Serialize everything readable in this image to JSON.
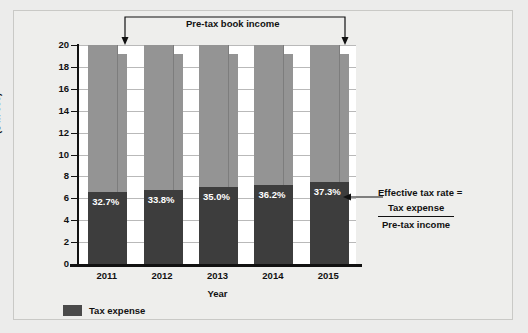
{
  "chart_data": {
    "type": "bar",
    "title": "",
    "subtitle": "",
    "xlabel": "Year",
    "ylabel": "($ in 000)",
    "ylim": [
      0,
      20
    ],
    "yticks": [
      0,
      2,
      4,
      6,
      8,
      10,
      12,
      14,
      16,
      18,
      20
    ],
    "grid": true,
    "legend_position": "bottom-left",
    "stacked": true,
    "categories": [
      "2011",
      "2012",
      "2013",
      "2014",
      "2015"
    ],
    "series": [
      {
        "name": "Tax expense",
        "values": [
          6.54,
          6.76,
          7.0,
          7.24,
          7.46
        ],
        "color": "#3d3d3d"
      },
      {
        "name": "Pre-tax book income",
        "values": [
          20,
          20,
          20,
          20,
          20
        ],
        "color": "#949494"
      }
    ],
    "data_labels": [
      "32.7%",
      "33.8%",
      "35.0%",
      "36.2%",
      "37.3%"
    ],
    "annotations": [
      {
        "name": "pre-tax-book-income",
        "text": "Pre-tax book income",
        "position": "top"
      },
      {
        "name": "effective-tax-rate",
        "text": "Effective tax rate = Tax expense / Pre-tax income",
        "position": "right"
      }
    ]
  },
  "axes": {
    "y_title": "($ in 000)",
    "x_title": "Year",
    "y_ticks": [
      "20",
      "18",
      "16",
      "14",
      "12",
      "10",
      "8",
      "6",
      "4",
      "2",
      "0"
    ],
    "x_ticks": [
      "2011",
      "2012",
      "2013",
      "2014",
      "2015"
    ]
  },
  "bars": [
    {
      "year": "2011",
      "pct_label": "32.7%",
      "total": 20,
      "tax_expense": 6.54
    },
    {
      "year": "2012",
      "pct_label": "33.8%",
      "total": 20,
      "tax_expense": 6.76
    },
    {
      "year": "2013",
      "pct_label": "35.0%",
      "total": 20,
      "tax_expense": 7.0
    },
    {
      "year": "2014",
      "pct_label": "36.2%",
      "total": 20,
      "tax_expense": 7.24
    },
    {
      "year": "2015",
      "pct_label": "37.3%",
      "total": 20,
      "tax_expense": 7.46
    }
  ],
  "legend": {
    "items": [
      {
        "label": "Tax expense",
        "color": "#4a4a4a"
      }
    ]
  },
  "annotation_top": {
    "label": "Pre-tax book income"
  },
  "annotation_right": {
    "line1": "Effective tax rate =",
    "numerator": "Tax expense",
    "denominator": "Pre-tax income"
  },
  "colors": {
    "page_background": "#ececeb",
    "panel_background": "#eeeeec",
    "plot_background": "#ffffff",
    "bar_gray": "#949494",
    "bar_dark": "#3d3d3d",
    "gridline": "#b9b9b9",
    "axis": "#111111",
    "label_text": "#111111",
    "data_label_text": "#ffffff"
  }
}
